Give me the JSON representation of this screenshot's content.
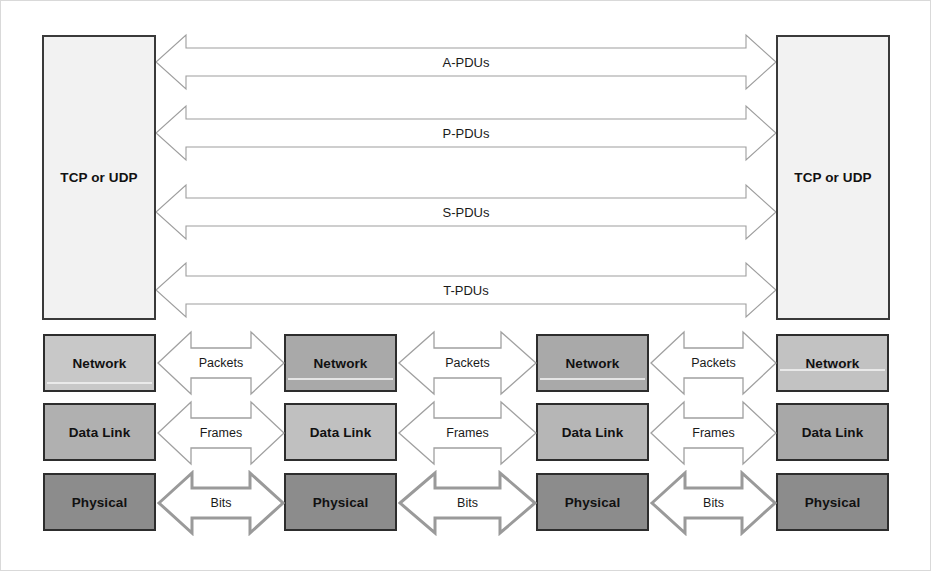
{
  "diagram": {
    "canvas": {
      "width": 931,
      "height": 571,
      "background": "#ffffff"
    }
  },
  "colors": {
    "transport_fill": "#f2f2f2",
    "transport_border": "#3a3a3a",
    "network_fill": "#c8c8c8",
    "datalink_fill": "#b0b0b0",
    "physical_fill": "#8c8c8c",
    "arrow_stroke": "#9a9a9a",
    "arrow_stroke_heavy": "#8f8f8f",
    "arrow_fill": "#ffffff",
    "text": "#111111",
    "page_border": "#d9d9d9"
  },
  "transport": {
    "left": {
      "label": "TCP or UDP"
    },
    "right": {
      "label": "TCP or UDP"
    }
  },
  "pdus": [
    {
      "id": "a-pdus",
      "label": "A-PDUs"
    },
    {
      "id": "p-pdus",
      "label": "P-PDUs"
    },
    {
      "id": "s-pdus",
      "label": "S-PDUs"
    },
    {
      "id": "t-pdus",
      "label": "T-PDUs"
    }
  ],
  "layers": [
    {
      "id": "network",
      "label": "Network",
      "fill": "#c8c8c8"
    },
    {
      "id": "data-link",
      "label": "Data Link",
      "fill": "#b0b0b0"
    },
    {
      "id": "physical",
      "label": "Physical",
      "fill": "#8c8c8c"
    }
  ],
  "columns": [
    {
      "id": "col-1",
      "boxes": [
        "Network",
        "Data Link",
        "Physical"
      ]
    },
    {
      "id": "col-2",
      "boxes": [
        "Network",
        "Data Link",
        "Physical"
      ]
    },
    {
      "id": "col-3",
      "boxes": [
        "Network",
        "Data Link",
        "Physical"
      ]
    },
    {
      "id": "col-4",
      "boxes": [
        "Network",
        "Data Link",
        "Physical"
      ]
    }
  ],
  "segment_labels": [
    {
      "id": "packets",
      "label": "Packets"
    },
    {
      "id": "frames",
      "label": "Frames"
    },
    {
      "id": "bits",
      "label": "Bits"
    }
  ],
  "gaps": [
    {
      "id": "gap-1",
      "packets": "Packets",
      "frames": "Frames",
      "bits": "Bits"
    },
    {
      "id": "gap-2",
      "packets": "Packets",
      "frames": "Frames",
      "bits": "Bits"
    },
    {
      "id": "gap-3",
      "packets": "Packets",
      "frames": "Frames",
      "bits": "Bits"
    }
  ]
}
